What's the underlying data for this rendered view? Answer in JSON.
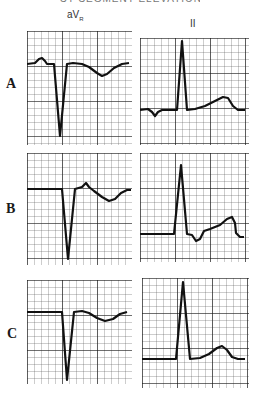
{
  "header": {
    "title_cut": "ST SEGMENT ELEVATION"
  },
  "columns": [
    {
      "label": "aV",
      "sub": "R"
    },
    {
      "label": "II"
    }
  ],
  "rows": [
    {
      "label": "A"
    },
    {
      "label": "B"
    },
    {
      "label": "C"
    }
  ],
  "grid": {
    "minor_color": "#444444",
    "major_color": "#111111",
    "trace_color": "#111111"
  },
  "panels": {
    "A_aVR": {
      "desc": "P wave upright, deep QS complex, inverted T wave"
    },
    "A_II": {
      "desc": "Inverted P wave, tall R wave, upright T wave"
    },
    "B_aVR": {
      "desc": "Flat baseline, deep QS complex, small upright deflection, inverted T wave"
    },
    "B_II": {
      "desc": "Flat baseline, tall R wave, S dip, rising ST segment, upright T wave"
    },
    "C_aVR": {
      "desc": "Flat baseline, deep QS complex, inverted T wave"
    },
    "C_II": {
      "desc": "Flat baseline, tall R wave, upright T wave"
    }
  }
}
